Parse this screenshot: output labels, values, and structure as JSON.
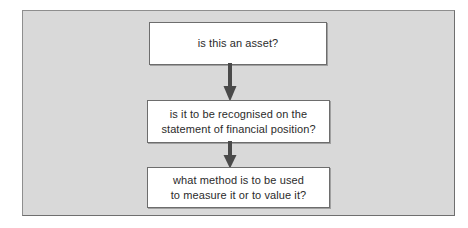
{
  "diagram": {
    "background_color": "#d9d9d9",
    "frame_border_color": "#8e8e8e",
    "box_fill_color": "#ffffff",
    "box_border_color": "#6d6d6d",
    "arrow_color": "#4a4a4a",
    "text_color": "#2b2b2b",
    "nodes": [
      {
        "id": "asset",
        "name": "is-this-an-asset",
        "lines": [
          "is this an asset?"
        ]
      },
      {
        "id": "recognition",
        "name": "is-it-to-be-recognised",
        "lines": [
          "is it to be recognised on the",
          "statement of financial position?"
        ]
      },
      {
        "id": "measurement",
        "name": "what-method-to-measure",
        "lines": [
          "what method is to be used",
          "to measure it or to value it?"
        ]
      }
    ],
    "connectors": [
      {
        "id": "arrow-1",
        "from": "asset",
        "to": "recognition",
        "icon": "down-arrow-icon"
      },
      {
        "id": "arrow-2",
        "from": "recognition",
        "to": "measurement",
        "icon": "down-arrow-icon"
      }
    ]
  }
}
